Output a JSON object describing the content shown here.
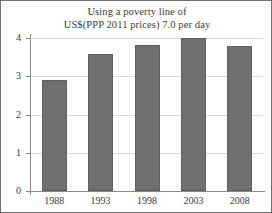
{
  "chart_data": {
    "type": "bar",
    "title": "Using a poverty line of US$(PPP 2011 prices) 7.0 per day",
    "title_lines": [
      "Using a poverty line of",
      "US$(PPP 2011 prices) 7.0 per day"
    ],
    "categories": [
      "1988",
      "1993",
      "1998",
      "2003",
      "2008"
    ],
    "values": [
      2.9,
      3.57,
      3.82,
      4.0,
      3.79
    ],
    "xlabel": "",
    "ylabel": "",
    "ylim": [
      0,
      4
    ],
    "yticks": [
      "0",
      "1",
      "2",
      "3",
      "4"
    ],
    "ytick_values": [
      0,
      1,
      2,
      3,
      4
    ],
    "grid": "horizontal",
    "legend": "none",
    "bar_color": "#707070",
    "grid_color": "#d8d8d8",
    "axis_color": "#8a8a8a",
    "text_color": "#3b3b3b"
  }
}
